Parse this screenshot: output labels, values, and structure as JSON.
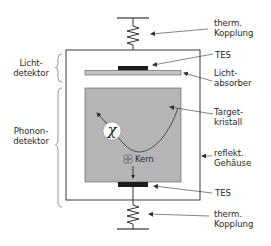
{
  "diagram": {
    "type": "detector-schematic",
    "colors": {
      "line": "#333333",
      "crystal_fill": "#b5b5b5",
      "absorber_fill": "#c4c4c4",
      "tes_fill": "#1c1c1c",
      "housing_stroke": "#3a3a3a",
      "chi_circle_fill": "#ffffff"
    },
    "labels_right": {
      "therm_top_line1": "therm.",
      "therm_top_line2": "Kopplung",
      "tes_top": "TES",
      "absorber_line1": "Licht-",
      "absorber_line2": "absorber",
      "target_line1": "Target-",
      "target_line2": "kristall",
      "housing_line1": "reflekt.",
      "housing_line2": "Gehäuse",
      "tes_bottom": "TES",
      "therm_bottom_line1": "therm.",
      "therm_bottom_line2": "Kopplung"
    },
    "labels_left": {
      "light_detector_line1": "Licht-",
      "light_detector_line2": "detektor",
      "phonon_detector_line1": "Phonon-",
      "phonon_detector_line2": "detektor"
    },
    "inner": {
      "particle_symbol": "χ",
      "nucleus_label": "Kern"
    }
  }
}
